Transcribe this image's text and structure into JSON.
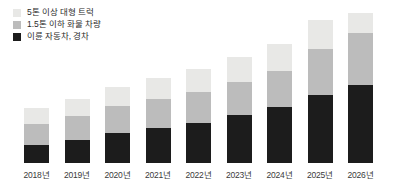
{
  "chart_data": {
    "type": "bar",
    "stacked": true,
    "title": "",
    "subtitle": "",
    "xlabel": "",
    "ylabel": "",
    "grid": false,
    "legend_position": "top-left",
    "categories": [
      "2018년",
      "2019년",
      "2020년",
      "2021년",
      "2022년",
      "2023년",
      "2024년",
      "2025년",
      "2026년"
    ],
    "series": [
      {
        "name": "이륜 자동차, 경차",
        "color": "#1c1c1c",
        "values": [
          18,
          23,
          30,
          35,
          40,
          48,
          56,
          68,
          78
        ]
      },
      {
        "name": "1.5톤 이하 화물 차량",
        "color": "#bcbcbc",
        "values": [
          21,
          24,
          27,
          29,
          31,
          33,
          36,
          46,
          52
        ]
      },
      {
        "name": "5톤 이상 대형 트럭",
        "color": "#e8e8e6",
        "values": [
          16,
          17,
          19,
          21,
          23,
          25,
          27,
          29,
          20
        ]
      }
    ],
    "totals": [
      55,
      64,
      76,
      85,
      94,
      106,
      119,
      143,
      150
    ],
    "ylim": [
      0,
      150
    ],
    "unit": "px"
  },
  "legend": {
    "items": [
      {
        "label": "5톤 이상 대형 트럭",
        "color": "#e8e8e6"
      },
      {
        "label": "1.5톤 이하 화물 차량",
        "color": "#bcbcbc"
      },
      {
        "label": "이륜 자동차, 경차",
        "color": "#1c1c1c"
      }
    ]
  },
  "colors": {
    "background": "#ffffff",
    "light": "#e8e8e6",
    "mid": "#bcbcbc",
    "dark": "#1c1c1c",
    "text": "#2b2b2b",
    "axis_text": "#3a3a3a"
  }
}
